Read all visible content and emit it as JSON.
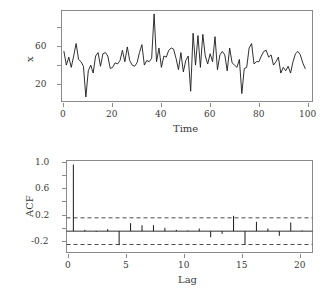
{
  "figure": {
    "kind": "two-panel-statistical-figure",
    "background": "#ffffff",
    "line_color": "#1a1a1a",
    "frame_color": "#8a8a8a",
    "dashed_bound_color": "#4d4d4d"
  },
  "chart_data": [
    {
      "type": "line",
      "id": "time-series",
      "title": "",
      "xlabel": "Time",
      "ylabel": "x",
      "xlim": [
        0,
        103
      ],
      "ylim": [
        8,
        88
      ],
      "grid": false,
      "legend": null,
      "xticks": [
        0,
        20,
        40,
        60,
        80,
        100
      ],
      "xtick_labels": [
        "0",
        "20",
        "40",
        "60",
        "80",
        "100"
      ],
      "yticks": [
        20,
        60
      ],
      "ytick_labels": [
        "20",
        "60"
      ],
      "yticks_minor": [
        40,
        80
      ],
      "x": [
        1,
        2,
        3,
        4,
        5,
        6,
        7,
        8,
        9,
        10,
        11,
        12,
        13,
        14,
        15,
        16,
        17,
        18,
        19,
        20,
        21,
        22,
        23,
        24,
        25,
        26,
        27,
        28,
        29,
        30,
        31,
        32,
        33,
        34,
        35,
        36,
        37,
        38,
        39,
        40,
        41,
        42,
        43,
        44,
        45,
        46,
        47,
        48,
        49,
        50,
        51,
        52,
        53,
        54,
        55,
        56,
        57,
        58,
        59,
        60,
        61,
        62,
        63,
        64,
        65,
        66,
        67,
        68,
        69,
        70,
        71,
        72,
        73,
        74,
        75,
        76,
        77,
        78,
        79,
        80,
        81,
        82,
        83,
        84,
        85,
        86,
        87,
        88,
        89,
        90,
        91,
        92,
        93,
        94,
        95,
        96,
        97,
        98,
        99,
        100
      ],
      "values": [
        52,
        40,
        47,
        38,
        48,
        59,
        45,
        43,
        39,
        12,
        35,
        40,
        33,
        48,
        51,
        39,
        50,
        51,
        48,
        37,
        38,
        42,
        41,
        44,
        53,
        43,
        56,
        44,
        40,
        39,
        42,
        51,
        58,
        40,
        44,
        43,
        46,
        85,
        43,
        55,
        38,
        48,
        47,
        53,
        55,
        54,
        46,
        36,
        51,
        34,
        44,
        48,
        17,
        68,
        40,
        66,
        38,
        67,
        48,
        41,
        50,
        43,
        65,
        36,
        49,
        52,
        49,
        35,
        55,
        42,
        40,
        38,
        45,
        15,
        37,
        38,
        55,
        59,
        41,
        43,
        43,
        48,
        52,
        53,
        47,
        49,
        40,
        43,
        47,
        33,
        38,
        35,
        39,
        33,
        43,
        50,
        52,
        49,
        42,
        37
      ]
    },
    {
      "type": "bar",
      "id": "acf-correlogram",
      "title": "",
      "xlabel": "Lag",
      "ylabel": "ACF",
      "xlim": [
        -0.6,
        20.9
      ],
      "ylim": [
        -0.32,
        1.06
      ],
      "grid": false,
      "legend": null,
      "xticks": [
        0,
        5,
        10,
        15,
        20
      ],
      "xtick_labels": [
        "0",
        "5",
        "10",
        "15",
        "20"
      ],
      "yticks": [
        -0.2,
        0.2,
        0.6,
        1.0
      ],
      "ytick_labels": [
        "-0.2",
        "0.2",
        "0.6",
        "1.0"
      ],
      "yticks_minor": [
        0.0,
        0.4,
        0.8
      ],
      "zero_line": 0,
      "significance_bounds": [
        0.2,
        -0.2
      ],
      "bound_style": "dashed",
      "categories": [
        0,
        1,
        2,
        3,
        4,
        5,
        6,
        7,
        8,
        9,
        10,
        11,
        12,
        13,
        14,
        15,
        16,
        17,
        18,
        19,
        20
      ],
      "values": [
        1.0,
        0.02,
        -0.01,
        0.03,
        -0.21,
        0.12,
        0.09,
        0.09,
        0.05,
        0.02,
        0.01,
        0.04,
        -0.09,
        -0.04,
        0.23,
        -0.2,
        0.14,
        0.04,
        -0.07,
        0.13,
        0.01
      ]
    }
  ]
}
